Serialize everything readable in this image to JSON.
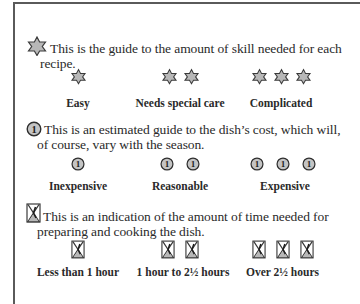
{
  "sections": {
    "skill": {
      "icon": "star-of-david-icon",
      "line1": "This is the guide to the amount of skill needed for each",
      "line2": "recipe.",
      "levels": [
        {
          "count": 1,
          "label": "Easy"
        },
        {
          "count": 2,
          "label": "Needs special care"
        },
        {
          "count": 3,
          "label": "Complicated"
        }
      ]
    },
    "cost": {
      "icon": "coin-icon",
      "coin_glyph": "1",
      "line1": "This is an estimated guide to the dish’s cost, which will,",
      "line2": "of course, vary with the season.",
      "levels": [
        {
          "count": 1,
          "label": "Inexpensive"
        },
        {
          "count": 2,
          "label": "Reasonable"
        },
        {
          "count": 3,
          "label": "Expensive"
        }
      ]
    },
    "time": {
      "icon": "hourglass-icon",
      "line1": "This is an indication of the amount of time needed for",
      "line2": "preparing and cooking the dish.",
      "levels": [
        {
          "count": 1,
          "label": "Less than 1 hour"
        },
        {
          "count": 2,
          "label": "1 hour to 2½ hours"
        },
        {
          "count": 3,
          "label": "Over 2½ hours"
        }
      ]
    }
  },
  "colors": {
    "icon_fill": "#b8b8b8",
    "icon_stroke": "#3a3a3a",
    "frame": "#5a5a5a"
  }
}
